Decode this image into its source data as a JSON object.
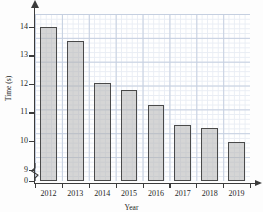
{
  "chart_data": {
    "type": "bar",
    "title": "",
    "xlabel": "Year",
    "ylabel": "Time (s)",
    "categories": [
      "2012",
      "2013",
      "2014",
      "2015",
      "2016",
      "2017",
      "2018",
      "2019"
    ],
    "values": [
      14.0,
      13.5,
      12.05,
      11.8,
      11.25,
      10.55,
      10.45,
      9.95
    ],
    "ylim": [
      8.6,
      14.45
    ],
    "yticks": [
      0,
      9,
      10,
      11,
      12,
      13,
      14
    ],
    "ytick_labels": [
      "0",
      "9",
      "10",
      "11",
      "12",
      "13",
      "14"
    ],
    "y_axis_break": true,
    "grid": true,
    "grid_major_color": "#c5cfe0",
    "grid_minor_color": "#e9edf4",
    "bar_fill_color": "#b2b2b2",
    "bar_edge_color": "#4a4a4a",
    "axis_color": "#3b3b3b",
    "legend": null,
    "legend_position": "none",
    "series": [
      {
        "name": "Time",
        "values": [
          14.0,
          13.5,
          12.05,
          11.8,
          11.25,
          10.55,
          10.45,
          9.95
        ]
      }
    ]
  },
  "axes": {
    "y_title": "Time (s)",
    "x_title": "Year",
    "y_tick_labels": [
      "14",
      "13",
      "12",
      "11",
      "10",
      "9",
      "0"
    ],
    "x_tick_labels": [
      "2012",
      "2013",
      "2014",
      "2015",
      "2016",
      "2017",
      "2018",
      "2019"
    ]
  }
}
